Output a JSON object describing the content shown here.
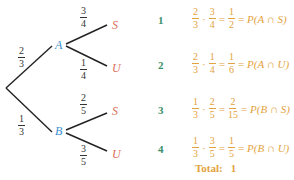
{
  "tree": {
    "first_level": [
      {
        "node": "A",
        "prob": {
          "num": "2",
          "den": "3"
        }
      },
      {
        "node": "B",
        "prob": {
          "num": "1",
          "den": "3"
        }
      }
    ],
    "second_level": [
      {
        "parent": "A",
        "node": "S",
        "prob": {
          "num": "3",
          "den": "4"
        }
      },
      {
        "parent": "A",
        "node": "U",
        "prob": {
          "num": "1",
          "den": "4"
        }
      },
      {
        "parent": "B",
        "node": "S",
        "prob": {
          "num": "2",
          "den": "5"
        }
      },
      {
        "parent": "B",
        "node": "U",
        "prob": {
          "num": "3",
          "den": "5"
        }
      }
    ]
  },
  "outcomes": [
    {
      "index": "1",
      "f1": {
        "num": "2",
        "den": "3"
      },
      "f2": {
        "num": "3",
        "den": "4"
      },
      "result": {
        "num": "1",
        "den": "2"
      },
      "label": "P(A ∩ S)"
    },
    {
      "index": "2",
      "f1": {
        "num": "2",
        "den": "3"
      },
      "f2": {
        "num": "1",
        "den": "4"
      },
      "result": {
        "num": "1",
        "den": "6"
      },
      "label": "P(A ∩ U)"
    },
    {
      "index": "3",
      "f1": {
        "num": "1",
        "den": "3"
      },
      "f2": {
        "num": "2",
        "den": "5"
      },
      "result": {
        "num": "2",
        "den": "15"
      },
      "label": "P(B ∩ S)"
    },
    {
      "index": "4",
      "f1": {
        "num": "1",
        "den": "3"
      },
      "f2": {
        "num": "3",
        "den": "5"
      },
      "result": {
        "num": "1",
        "den": "5"
      },
      "label": "P(B ∩ U)"
    }
  ],
  "symbols": {
    "dot": "·",
    "eq": "="
  },
  "total": {
    "label": "Total:",
    "value": "1"
  },
  "colors": {
    "branch_node": "#3a8fd0",
    "leaf_node": "#d9705a",
    "index": "#3a8f6a",
    "equation": "#e3a23d",
    "line": "#222222"
  }
}
